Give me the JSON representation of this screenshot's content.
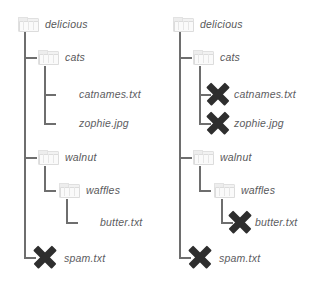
{
  "diagram": {
    "colors": {
      "line": "#6e6e6e",
      "text": "#58585a",
      "folder": "#f2f2f2",
      "xmark": "#2e2e2e",
      "background": "#ffffff"
    },
    "trees": [
      {
        "id": "before",
        "nodes": [
          {
            "name": "delicious",
            "type": "folder",
            "depth": 0,
            "deleted": false
          },
          {
            "name": "cats",
            "type": "folder",
            "depth": 1,
            "deleted": false
          },
          {
            "name": "catnames.txt",
            "type": "file",
            "depth": 2,
            "deleted": false
          },
          {
            "name": "zophie.jpg",
            "type": "file",
            "depth": 2,
            "deleted": false
          },
          {
            "name": "walnut",
            "type": "folder",
            "depth": 1,
            "deleted": false
          },
          {
            "name": "waffles",
            "type": "folder",
            "depth": 2,
            "deleted": false
          },
          {
            "name": "butter.txt",
            "type": "file",
            "depth": 3,
            "deleted": false
          },
          {
            "name": "spam.txt",
            "type": "file",
            "depth": 1,
            "deleted": true
          }
        ]
      },
      {
        "id": "after",
        "nodes": [
          {
            "name": "delicious",
            "type": "folder",
            "depth": 0,
            "deleted": false
          },
          {
            "name": "cats",
            "type": "folder",
            "depth": 1,
            "deleted": false
          },
          {
            "name": "catnames.txt",
            "type": "file",
            "depth": 2,
            "deleted": true
          },
          {
            "name": "zophie.jpg",
            "type": "file",
            "depth": 2,
            "deleted": true
          },
          {
            "name": "walnut",
            "type": "folder",
            "depth": 1,
            "deleted": false
          },
          {
            "name": "waffles",
            "type": "folder",
            "depth": 2,
            "deleted": false
          },
          {
            "name": "butter.txt",
            "type": "file",
            "depth": 3,
            "deleted": true
          },
          {
            "name": "spam.txt",
            "type": "file",
            "depth": 1,
            "deleted": true
          }
        ]
      }
    ]
  }
}
